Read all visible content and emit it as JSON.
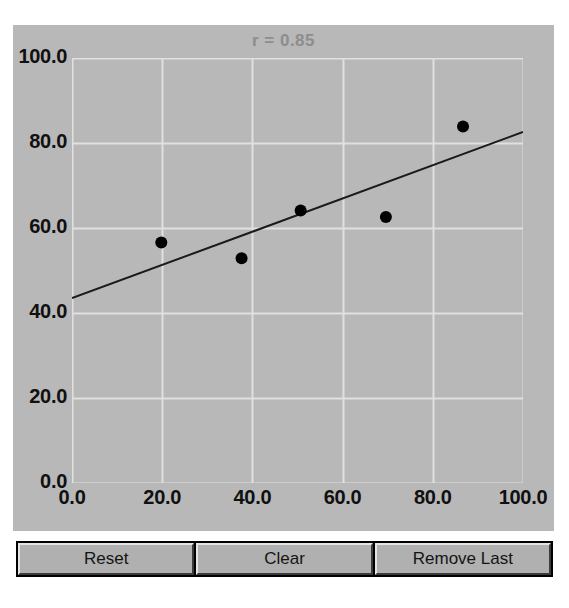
{
  "window": {
    "background": "#ffffff",
    "panel_background": "#b8b8b8"
  },
  "chart_data": {
    "type": "scatter",
    "title": "r = 0.85",
    "xlabel": "",
    "ylabel": "",
    "xlim": [
      0,
      100
    ],
    "ylim": [
      0,
      100
    ],
    "grid": true,
    "legend": null,
    "xticks": [
      "0.0",
      "20.0",
      "40.0",
      "60.0",
      "80.0",
      "100.0"
    ],
    "yticks": [
      "0.0",
      "20.0",
      "40.0",
      "60.0",
      "80.0",
      "100.0"
    ],
    "xtick_values": [
      0,
      20,
      40,
      60,
      80,
      100
    ],
    "ytick_values": [
      0,
      20,
      40,
      60,
      80,
      100
    ],
    "points": [
      {
        "x": 19.8,
        "y": 56.6
      },
      {
        "x": 37.6,
        "y": 52.9
      },
      {
        "x": 50.7,
        "y": 64.1
      },
      {
        "x": 69.6,
        "y": 62.6
      },
      {
        "x": 86.7,
        "y": 83.9
      }
    ],
    "series": [
      {
        "name": "data-points",
        "type": "scatter",
        "marker_color": "#000000",
        "marker_size": 11,
        "x": [
          19.8,
          37.6,
          50.7,
          69.6,
          86.7
        ],
        "values": [
          56.6,
          52.9,
          64.1,
          62.6,
          83.9
        ]
      },
      {
        "name": "regression-line",
        "type": "line",
        "line_color": "#1a1a1a",
        "line_width": 2,
        "x": [
          0,
          100
        ],
        "values": [
          43.5,
          82.6
        ]
      }
    ],
    "correlation": 0.85,
    "title_color": "#8d8d8d",
    "grid_color": "#e0e0e0",
    "point_color": "#000000",
    "line_color": "#1a1a1a"
  },
  "toolbar": {
    "buttons": [
      {
        "label": "Reset",
        "name": "reset-button"
      },
      {
        "label": "Clear",
        "name": "clear-button"
      },
      {
        "label": "Remove Last",
        "name": "remove-last-button"
      }
    ]
  }
}
